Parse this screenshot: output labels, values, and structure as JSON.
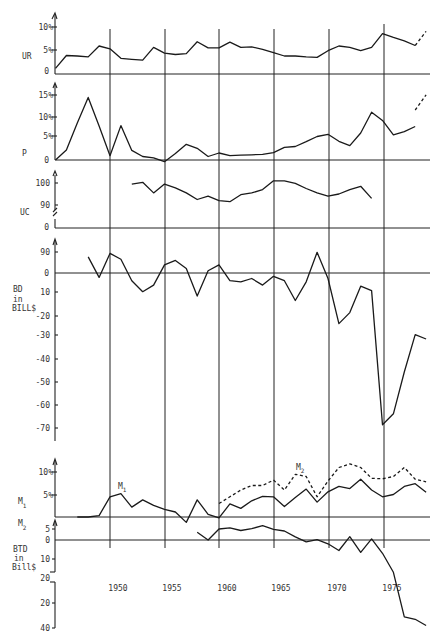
{
  "chart_data": [
    {
      "id": "UR",
      "type": "line",
      "ylabel": "UR",
      "yticks": [
        "0",
        "5%",
        "10%"
      ],
      "ytick_values": [
        0,
        5,
        10
      ],
      "ylim": [
        0,
        12
      ],
      "x": [
        1945,
        1946,
        1947,
        1948,
        1949,
        1950,
        1951,
        1952,
        1953,
        1954,
        1955,
        1956,
        1957,
        1958,
        1959,
        1960,
        1961,
        1962,
        1963,
        1964,
        1965,
        1966,
        1967,
        1968,
        1969,
        1970,
        1971,
        1972,
        1973,
        1974,
        1975,
        1976,
        1977,
        1978
      ],
      "series": [
        {
          "name": "UR",
          "style": "solid",
          "values": [
            1.2,
            3.9,
            3.8,
            3.6,
            5.9,
            5.3,
            3.3,
            3.1,
            2.9,
            5.6,
            4.4,
            4.1,
            4.3,
            6.8,
            5.5,
            5.5,
            6.7,
            5.6,
            5.7,
            5.2,
            4.5,
            3.8,
            3.8,
            3.6,
            3.5,
            4.9,
            5.9,
            5.6,
            4.9,
            5.6,
            8.5,
            7.7,
            7.0,
            6.0
          ]
        },
        {
          "name": "UR (projected)",
          "style": "dashed",
          "x": [
            1978,
            1979
          ],
          "values": [
            6.0,
            9.0
          ]
        }
      ]
    },
    {
      "id": "P",
      "type": "line",
      "ylabel": "P",
      "yticks": [
        "0",
        "5%",
        "10%",
        "15%"
      ],
      "ytick_values": [
        0,
        5,
        10,
        15
      ],
      "ylim": [
        0,
        17
      ],
      "x": [
        1945,
        1946,
        1947,
        1948,
        1949,
        1950,
        1951,
        1952,
        1953,
        1954,
        1955,
        1956,
        1957,
        1958,
        1959,
        1960,
        1961,
        1962,
        1963,
        1964,
        1965,
        1966,
        1967,
        1968,
        1969,
        1970,
        1971,
        1972,
        1973,
        1974,
        1975,
        1976,
        1977,
        1978
      ],
      "series": [
        {
          "name": "P",
          "style": "solid",
          "values": [
            0,
            2.3,
            8.5,
            14.4,
            7.8,
            1.0,
            7.9,
            2.2,
            0.8,
            0.5,
            -0.4,
            1.5,
            3.6,
            2.7,
            0.8,
            1.6,
            1.0,
            1.1,
            1.2,
            1.3,
            1.7,
            2.9,
            3.1,
            4.2,
            5.4,
            5.9,
            4.3,
            3.3,
            6.2,
            11.0,
            9.1,
            5.8,
            6.5,
            7.7
          ]
        },
        {
          "name": "P (projected)",
          "style": "dashed",
          "x": [
            1978,
            1979
          ],
          "values": [
            11.5,
            15.0
          ]
        }
      ]
    },
    {
      "id": "UC",
      "type": "line",
      "ylabel": "UC",
      "yticks": [
        "0",
        "90",
        "100"
      ],
      "ytick_values": [
        0,
        90,
        100
      ],
      "axis_break": true,
      "x": [
        1952,
        1953,
        1954,
        1955,
        1956,
        1957,
        1958,
        1959,
        1960,
        1961,
        1962,
        1963,
        1964,
        1965,
        1966,
        1967,
        1968,
        1969,
        1970,
        1971,
        1972,
        1973,
        1974
      ],
      "series": [
        {
          "name": "UC",
          "style": "solid",
          "values": [
            99.5,
            100.3,
            95.5,
            99.5,
            97.8,
            95.5,
            92.5,
            94.0,
            92.0,
            91.5,
            94.7,
            95.5,
            97.0,
            101.0,
            101.0,
            99.8,
            97.5,
            95.5,
            94.0,
            95.0,
            97.0,
            98.5,
            93.0
          ]
        }
      ]
    },
    {
      "id": "BD",
      "type": "line",
      "ylabel": "BD in BILL$",
      "yticks": [
        "90",
        "0",
        "10",
        "-20",
        "-30",
        "-40",
        "-50",
        "-60",
        "-70"
      ],
      "ytick_values": [
        9,
        0,
        -10,
        -20,
        -30,
        -40,
        -50,
        -60,
        -70
      ],
      "ylim": [
        -75,
        12
      ],
      "x": [
        1948,
        1949,
        1950,
        1951,
        1952,
        1953,
        1954,
        1955,
        1956,
        1957,
        1958,
        1959,
        1960,
        1961,
        1962,
        1963,
        1964,
        1965,
        1966,
        1967,
        1968,
        1969,
        1970,
        1971,
        1972,
        1973,
        1974,
        1975,
        1976,
        1977,
        1978,
        1979
      ],
      "series": [
        {
          "name": "BD",
          "style": "solid",
          "values": [
            7.0,
            -2.0,
            8.5,
            6.0,
            -3.5,
            -8.5,
            -5.5,
            3.5,
            5.5,
            2.0,
            -10.5,
            1.0,
            3.5,
            -3.5,
            -4.0,
            -2.5,
            -5.5,
            -1.5,
            -3.5,
            -12.5,
            -4.0,
            9.0,
            -2.5,
            -23.0,
            -18.0,
            -6.0,
            -8.0,
            -69.0,
            -64.0,
            -45.0,
            -28.0,
            -30.0
          ]
        }
      ]
    },
    {
      "id": "M1_M2",
      "type": "line",
      "ylabel": "M1",
      "yticks": [
        "5%",
        "10%"
      ],
      "ytick_values": [
        5,
        10
      ],
      "annotations": [
        "M1",
        "M2"
      ],
      "x": [
        1947,
        1948,
        1949,
        1950,
        1951,
        1952,
        1953,
        1954,
        1955,
        1956,
        1957,
        1958,
        1959,
        1960,
        1961,
        1962,
        1963,
        1964,
        1965,
        1966,
        1967,
        1968,
        1969,
        1970,
        1971,
        1972,
        1973,
        1974,
        1975,
        1976,
        1977,
        1978,
        1979
      ],
      "series": [
        {
          "name": "M1",
          "style": "solid",
          "values": [
            0,
            0,
            0.3,
            4.5,
            5.2,
            2.2,
            3.8,
            2.6,
            1.7,
            1.1,
            -1.2,
            3.8,
            0.6,
            -0.2,
            2.9,
            1.9,
            3.6,
            4.6,
            4.5,
            2.3,
            4.3,
            6.2,
            3.3,
            5.6,
            6.8,
            6.3,
            8.4,
            6.0,
            4.5,
            5.0,
            6.8,
            7.4,
            5.5
          ]
        },
        {
          "name": "M2",
          "style": "dashed",
          "x": [
            1960,
            1961,
            1962,
            1963,
            1964,
            1965,
            1966,
            1967,
            1968,
            1969,
            1970,
            1971,
            1972,
            1973,
            1974,
            1975,
            1976,
            1977,
            1978,
            1979
          ],
          "values": [
            3.0,
            4.5,
            6.0,
            7.0,
            7.0,
            8.2,
            6.0,
            9.5,
            9.0,
            4.5,
            8.0,
            11.0,
            11.8,
            11.0,
            8.6,
            8.5,
            9.0,
            11.0,
            8.4,
            7.8
          ]
        }
      ]
    },
    {
      "id": "BTD",
      "type": "line",
      "ylabel": "BTD in Bill$",
      "yticks": [
        "5",
        "0",
        "10",
        "20",
        "20",
        "40"
      ],
      "ytick_values": [
        5,
        0,
        -10,
        -20,
        -20,
        -40
      ],
      "axis_break": true,
      "x": [
        1958,
        1959,
        1960,
        1961,
        1962,
        1963,
        1964,
        1965,
        1966,
        1967,
        1968,
        1969,
        1970,
        1971,
        1972,
        1973,
        1974,
        1975,
        1976,
        1977,
        1978,
        1979
      ],
      "series": [
        {
          "name": "BTD",
          "style": "solid",
          "values": [
            3.5,
            0,
            5.0,
            5.5,
            4.3,
            5.2,
            6.5,
            4.8,
            4.1,
            1.4,
            -1.0,
            0.2,
            -2.0,
            -5.5,
            1.5,
            -6.5,
            0.5,
            -7.0,
            -17.0,
            -31.0,
            -33.0,
            -38.0
          ]
        }
      ]
    }
  ],
  "x_axis": {
    "ticks": [
      "1950",
      "1955",
      "1960",
      "1965",
      "1970",
      "1975"
    ],
    "tick_values": [
      1950,
      1955,
      1960,
      1965,
      1970,
      1975
    ]
  },
  "labels": {
    "ur": "UR",
    "p": "P",
    "uc": "UC",
    "bd1": "BD",
    "bd2": "in",
    "bd3": "BILL$",
    "m1": "M",
    "m1_sub": "1",
    "m2": "M",
    "m2_sub": "2",
    "btd1": "BTD",
    "btd2": "in",
    "btd3": "Bill$",
    "m1_annot": "M",
    "m1_annot_sub": "1",
    "m2_annot": "M",
    "m2_annot_sub": "2"
  },
  "ticks": {
    "ur_10": "10%",
    "ur_5": "5%",
    "ur_0": "0",
    "p_15": "15%",
    "p_10": "10%",
    "p_5": "5%",
    "p_0": "0",
    "uc_100": "100",
    "uc_90": "90",
    "uc_0": "0",
    "bd_90": "90",
    "bd_0": "0",
    "bd_10": "10",
    "bd_m20": "-20",
    "bd_m30": "-30",
    "bd_m40": "-40",
    "bd_m50": "-50",
    "bd_m60": "-60",
    "bd_m70": "-70",
    "m_10": "10%",
    "m_5": "5%",
    "btd_5": "5",
    "btd_0": "0",
    "btd_10": "10",
    "btd_20a": "20",
    "btd_20b": "20",
    "btd_40": "40"
  }
}
